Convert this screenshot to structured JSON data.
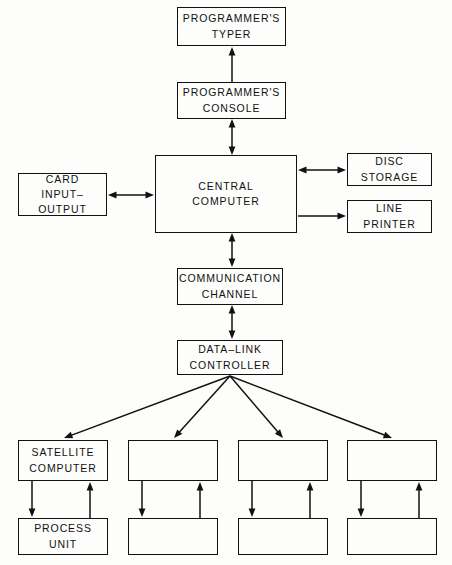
{
  "diagram": {
    "background_color": "#fdfdfc",
    "line_color": "#111111",
    "nodes": [
      {
        "id": "programmers-typer",
        "label_line1": "PROGRAMMER'S",
        "label_line2": "TYPER",
        "x": 177,
        "y": 7,
        "w": 109,
        "h": 39
      },
      {
        "id": "programmers-console",
        "label_line1": "PROGRAMMER'S",
        "label_line2": "CONSOLE",
        "x": 177,
        "y": 82,
        "w": 109,
        "h": 37
      },
      {
        "id": "central-computer",
        "label_line1": "CENTRAL",
        "label_line2": "COMPUTER",
        "x": 155,
        "y": 155,
        "w": 142,
        "h": 78
      },
      {
        "id": "card-input-output",
        "label_line1": "CARD",
        "label_line2": "INPUT–",
        "label_line3": "OUTPUT",
        "x": 18,
        "y": 173,
        "w": 89,
        "h": 43
      },
      {
        "id": "disc-storage",
        "label_line1": "DISC",
        "label_line2": "STORAGE",
        "x": 347,
        "y": 153,
        "w": 85,
        "h": 33
      },
      {
        "id": "line-printer",
        "label_line1": "LINE",
        "label_line2": "PRINTER",
        "x": 347,
        "y": 200,
        "w": 85,
        "h": 33
      },
      {
        "id": "communication-channel",
        "label_line1": "COMMUNICATION",
        "label_line2": "CHANNEL",
        "x": 177,
        "y": 268,
        "w": 106,
        "h": 37
      },
      {
        "id": "data-link-controller",
        "label_line1": "DATA–LINK",
        "label_line2": "CONTROLLER",
        "x": 177,
        "y": 340,
        "w": 106,
        "h": 35
      },
      {
        "id": "satellite-computer-1",
        "label_line1": "SATELLITE",
        "label_line2": "COMPUTER",
        "x": 18,
        "y": 440,
        "w": 90,
        "h": 41
      },
      {
        "id": "satellite-computer-2",
        "label_line1": "",
        "label_line2": "",
        "x": 128,
        "y": 440,
        "w": 90,
        "h": 41
      },
      {
        "id": "satellite-computer-3",
        "label_line1": "",
        "label_line2": "",
        "x": 238,
        "y": 440,
        "w": 90,
        "h": 41
      },
      {
        "id": "satellite-computer-4",
        "label_line1": "",
        "label_line2": "",
        "x": 347,
        "y": 440,
        "w": 90,
        "h": 41
      },
      {
        "id": "process-unit-1",
        "label_line1": "PROCESS",
        "label_line2": "UNIT",
        "x": 18,
        "y": 518,
        "w": 90,
        "h": 37
      },
      {
        "id": "process-unit-2",
        "label_line1": "",
        "label_line2": "",
        "x": 128,
        "y": 518,
        "w": 90,
        "h": 37
      },
      {
        "id": "process-unit-3",
        "label_line1": "",
        "label_line2": "",
        "x": 238,
        "y": 518,
        "w": 90,
        "h": 37
      },
      {
        "id": "process-unit-4",
        "label_line1": "",
        "label_line2": "",
        "x": 347,
        "y": 518,
        "w": 90,
        "h": 37
      }
    ],
    "edges": [
      {
        "id": "console-to-typer",
        "from": "programmers-console",
        "to": "programmers-typer",
        "x1": 232,
        "y1": 82,
        "x2": 232,
        "y2": 47,
        "arrow": "single-end"
      },
      {
        "id": "central-to-console",
        "from": "central-computer",
        "to": "programmers-console",
        "x1": 232,
        "y1": 155,
        "x2": 232,
        "y2": 119,
        "arrow": "double"
      },
      {
        "id": "card-io-to-central",
        "from": "card-input-output",
        "to": "central-computer",
        "x1": 108,
        "y1": 195,
        "x2": 154,
        "y2": 195,
        "arrow": "double"
      },
      {
        "id": "central-to-disc-storage",
        "from": "central-computer",
        "to": "disc-storage",
        "x1": 298,
        "y1": 170,
        "x2": 346,
        "y2": 170,
        "arrow": "double"
      },
      {
        "id": "central-to-line-printer",
        "from": "central-computer",
        "to": "line-printer",
        "x1": 298,
        "y1": 216,
        "x2": 346,
        "y2": 216,
        "arrow": "single-end"
      },
      {
        "id": "central-to-comm-channel",
        "from": "central-computer",
        "to": "communication-channel",
        "x1": 232,
        "y1": 233,
        "x2": 232,
        "y2": 267,
        "arrow": "double"
      },
      {
        "id": "comm-channel-to-data-link",
        "from": "communication-channel",
        "to": "data-link-controller",
        "x1": 232,
        "y1": 305,
        "x2": 232,
        "y2": 339,
        "arrow": "double"
      },
      {
        "id": "data-link-to-satellite-1",
        "from": "data-link-controller",
        "to": "satellite-computer-1",
        "x1": 230,
        "y1": 376,
        "x2": 64,
        "y2": 438,
        "arrow": "single-end"
      },
      {
        "id": "data-link-to-satellite-2",
        "from": "data-link-controller",
        "to": "satellite-computer-2",
        "x1": 230,
        "y1": 376,
        "x2": 174,
        "y2": 438,
        "arrow": "single-end"
      },
      {
        "id": "data-link-to-satellite-3",
        "from": "data-link-controller",
        "to": "satellite-computer-3",
        "x1": 230,
        "y1": 376,
        "x2": 283,
        "y2": 438,
        "arrow": "single-end"
      },
      {
        "id": "data-link-to-satellite-4",
        "from": "data-link-controller",
        "to": "satellite-computer-4",
        "x1": 230,
        "y1": 376,
        "x2": 392,
        "y2": 438,
        "arrow": "single-end"
      },
      {
        "id": "satellite-1-to-process-1",
        "from": "satellite-computer-1",
        "to": "process-unit-1",
        "x1": 32,
        "y1": 481,
        "x2": 32,
        "y2": 517,
        "arrow": "single-end"
      },
      {
        "id": "process-1-to-satellite-1",
        "from": "process-unit-1",
        "to": "satellite-computer-1",
        "x1": 90,
        "y1": 518,
        "x2": 90,
        "y2": 482,
        "arrow": "single-end"
      },
      {
        "id": "satellite-2-to-process-2",
        "from": "satellite-computer-2",
        "to": "process-unit-2",
        "x1": 142,
        "y1": 481,
        "x2": 142,
        "y2": 517,
        "arrow": "single-end"
      },
      {
        "id": "process-2-to-satellite-2",
        "from": "process-unit-2",
        "to": "satellite-computer-2",
        "x1": 200,
        "y1": 518,
        "x2": 200,
        "y2": 482,
        "arrow": "single-end"
      },
      {
        "id": "satellite-3-to-process-3",
        "from": "satellite-computer-3",
        "to": "process-unit-3",
        "x1": 252,
        "y1": 481,
        "x2": 252,
        "y2": 517,
        "arrow": "single-end"
      },
      {
        "id": "process-3-to-satellite-3",
        "from": "process-unit-3",
        "to": "satellite-computer-3",
        "x1": 310,
        "y1": 518,
        "x2": 310,
        "y2": 482,
        "arrow": "single-end"
      },
      {
        "id": "satellite-4-to-process-4",
        "from": "satellite-computer-4",
        "to": "process-unit-4",
        "x1": 361,
        "y1": 481,
        "x2": 361,
        "y2": 517,
        "arrow": "single-end"
      },
      {
        "id": "process-4-to-satellite-4",
        "from": "process-unit-4",
        "to": "satellite-computer-4",
        "x1": 419,
        "y1": 518,
        "x2": 419,
        "y2": 482,
        "arrow": "single-end"
      }
    ]
  }
}
